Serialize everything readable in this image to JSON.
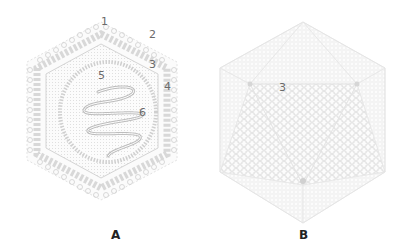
{
  "figure_a": {
    "panel_label": "A",
    "callouts": [
      {
        "id": "1",
        "label": "1"
      },
      {
        "id": "2",
        "label": "2"
      },
      {
        "id": "3",
        "label": "3"
      },
      {
        "id": "4",
        "label": "4"
      },
      {
        "id": "5",
        "label": "5"
      },
      {
        "id": "6",
        "label": "6"
      }
    ]
  },
  "figure_b": {
    "panel_label": "B",
    "callouts": [
      {
        "id": "3",
        "label": "3"
      }
    ]
  },
  "colors": {
    "line": "#cfcfcf",
    "line_dark": "#b8b8b8",
    "fill_light": "#f1f1f1",
    "text": "#6a6a6a",
    "panel_text": "#222222"
  }
}
